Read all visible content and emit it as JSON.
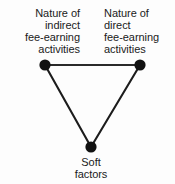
{
  "diagram": {
    "type": "triangle-relationship-diagram",
    "background_color": "#fdfdfd",
    "stroke_color": "#1c1c1c",
    "node_color": "#111111",
    "text_color": "#1b1b1b",
    "canvas": {
      "width": 175,
      "height": 184
    },
    "nodes": [
      {
        "id": "indirect",
        "label": "Nature of\nindirect\nfee-earning\nactivities",
        "label_lines": [
          "Nature of",
          "indirect",
          "fee-earning",
          "activities"
        ],
        "align": "right",
        "x": 45,
        "y": 65,
        "radius": 5.6
      },
      {
        "id": "direct",
        "label": "Nature of\ndirect\nfee-earning\nactivities",
        "label_lines": [
          "Nature of",
          "direct",
          "fee-earning",
          "activities"
        ],
        "align": "left",
        "x": 140,
        "y": 65,
        "radius": 5.6
      },
      {
        "id": "soft",
        "label": "Soft\nfactors",
        "label_lines": [
          "Soft",
          "factors"
        ],
        "align": "center",
        "x": 91,
        "y": 147,
        "radius": 5.6
      }
    ],
    "edges": [
      {
        "id": "indirect-direct",
        "from": "indirect",
        "to": "direct",
        "width": 2.1
      },
      {
        "id": "indirect-soft",
        "from": "indirect",
        "to": "soft",
        "width": 2.1
      },
      {
        "id": "direct-soft",
        "from": "direct",
        "to": "soft",
        "width": 2.1
      }
    ]
  }
}
